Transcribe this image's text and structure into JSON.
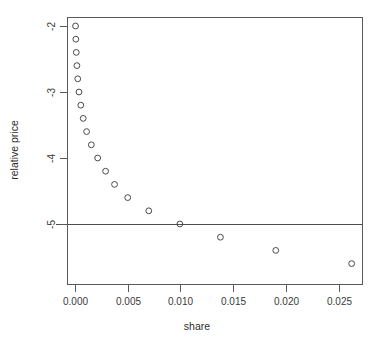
{
  "chart_data": {
    "type": "scatter",
    "title": "",
    "xlabel": "share",
    "ylabel": "relative price",
    "xlim": [
      -0.0012,
      0.0275
    ],
    "ylim": [
      -5.95,
      -1.88
    ],
    "grid": false,
    "legend": null,
    "xticks": [
      0.0,
      0.005,
      0.01,
      0.015,
      0.02,
      0.025
    ],
    "xticklabels": [
      "0.000",
      "0.005",
      "0.010",
      "0.015",
      "0.020",
      "0.025"
    ],
    "yticks": [
      -2,
      -3,
      -4,
      -5
    ],
    "yticklabels": [
      "-2",
      "-3",
      "-4",
      "-5"
    ],
    "marker": "open-circle",
    "marker_color": "#4a4a4a",
    "annotations": [
      {
        "type": "hline",
        "y": -5,
        "color": "#4d4d4d",
        "label": ""
      }
    ],
    "x": [
      5e-05,
      8e-05,
      0.00012,
      0.00018,
      0.00026,
      0.00038,
      0.00055,
      0.00078,
      0.0011,
      0.00155,
      0.00215,
      0.0029,
      0.00375,
      0.005,
      0.007,
      0.00995,
      0.0138,
      0.01905,
      0.02625
    ],
    "y": [
      -2.0,
      -2.2,
      -2.4,
      -2.6,
      -2.8,
      -3.0,
      -3.2,
      -3.4,
      -3.6,
      -3.8,
      -4.0,
      -4.2,
      -4.4,
      -4.6,
      -4.8,
      -5.0,
      -5.2,
      -5.4,
      -5.6
    ],
    "points": [
      {
        "x": 5e-05,
        "y": -2.0
      },
      {
        "x": 8e-05,
        "y": -2.2
      },
      {
        "x": 0.00012,
        "y": -2.4
      },
      {
        "x": 0.00018,
        "y": -2.6
      },
      {
        "x": 0.00026,
        "y": -2.8
      },
      {
        "x": 0.00038,
        "y": -3.0
      },
      {
        "x": 0.00055,
        "y": -3.2
      },
      {
        "x": 0.00078,
        "y": -3.4
      },
      {
        "x": 0.0011,
        "y": -3.6
      },
      {
        "x": 0.00155,
        "y": -3.8
      },
      {
        "x": 0.00215,
        "y": -4.0
      },
      {
        "x": 0.0029,
        "y": -4.2
      },
      {
        "x": 0.00375,
        "y": -4.4
      },
      {
        "x": 0.005,
        "y": -4.6
      },
      {
        "x": 0.007,
        "y": -4.8
      },
      {
        "x": 0.00995,
        "y": -5.0
      },
      {
        "x": 0.0138,
        "y": -5.2
      },
      {
        "x": 0.01905,
        "y": -5.4
      },
      {
        "x": 0.02625,
        "y": -5.6
      }
    ]
  }
}
